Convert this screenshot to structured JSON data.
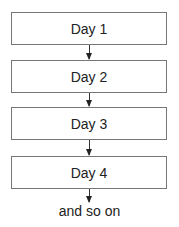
{
  "diagram": {
    "type": "flowchart",
    "nodes": [
      {
        "label": "Day 1"
      },
      {
        "label": "Day 2"
      },
      {
        "label": "Day 3"
      },
      {
        "label": "Day 4"
      }
    ],
    "edges": [
      {
        "from": "Day 1",
        "to": "Day 2"
      },
      {
        "from": "Day 2",
        "to": "Day 3"
      },
      {
        "from": "Day 3",
        "to": "Day 4"
      },
      {
        "from": "Day 4",
        "to": "and so on"
      }
    ],
    "caption": "and so on"
  }
}
